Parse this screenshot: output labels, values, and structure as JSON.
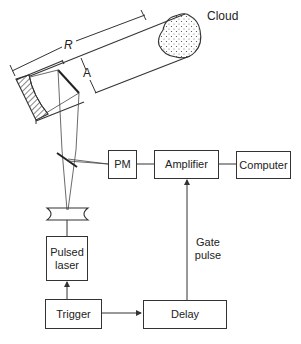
{
  "diagram": {
    "labels": {
      "cloud": "Cloud",
      "range": "R",
      "aperture": "A",
      "gate_pulse_line1": "Gate",
      "gate_pulse_line2": "pulse"
    },
    "blocks": {
      "pm": "PM",
      "amplifier": "Amplifier",
      "computer": "Computer",
      "pulsed_laser_line1": "Pulsed",
      "pulsed_laser_line2": "laser",
      "trigger": "Trigger",
      "delay": "Delay"
    },
    "connections": [
      {
        "from": "Trigger",
        "to": "Pulsed laser",
        "arrow": true
      },
      {
        "from": "Trigger",
        "to": "Delay",
        "arrow": true
      },
      {
        "from": "Delay",
        "to": "Amplifier",
        "arrow": true,
        "label": "Gate pulse"
      },
      {
        "from": "PM",
        "to": "Amplifier",
        "arrow": false
      },
      {
        "from": "Amplifier",
        "to": "Computer",
        "arrow": false
      },
      {
        "from": "Beam splitter",
        "to": "PM",
        "arrow": false
      }
    ],
    "colors": {
      "line": "#333333",
      "background": "#ffffff"
    }
  }
}
